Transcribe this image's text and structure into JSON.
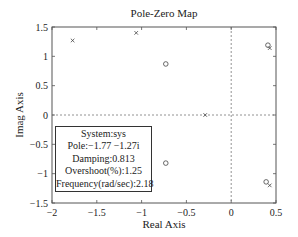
{
  "chart_data": {
    "type": "scatter",
    "title": "Pole-Zero Map",
    "xlabel": "Real Axis",
    "ylabel": "Imag Axis",
    "xlim": [
      -2,
      0.5
    ],
    "ylim": [
      -1.5,
      1.5
    ],
    "xticks": [
      "-2",
      "-1.5",
      "-1",
      "-0.5",
      "0",
      "0.5"
    ],
    "yticks": [
      "1.5",
      "1",
      "0.5",
      "0",
      "-0.5",
      "-1",
      "-1.5"
    ],
    "grid": false,
    "reference_lines": [
      "x=0 dashed",
      "y=0 dashed"
    ],
    "series": [
      {
        "name": "Poles",
        "marker": "x",
        "points": [
          [
            -1.77,
            1.27
          ],
          [
            -1.77,
            -1.27
          ],
          [
            -1.06,
            1.4
          ],
          [
            -0.29,
            0.0
          ],
          [
            0.43,
            1.14
          ],
          [
            0.43,
            -1.2
          ]
        ]
      },
      {
        "name": "Zeros",
        "marker": "o",
        "points": [
          [
            -0.73,
            0.87
          ],
          [
            -0.73,
            -0.82
          ],
          [
            0.41,
            1.19
          ],
          [
            0.39,
            -1.14
          ]
        ]
      }
    ],
    "datatip": {
      "system": "System:sys",
      "pole": "Pole:−1.77 −1.27i",
      "damping": "Damping:0.813",
      "overshoot": "Overshoot(%):1.25",
      "frequency": "Frequency(rad/sec):2.18"
    }
  }
}
